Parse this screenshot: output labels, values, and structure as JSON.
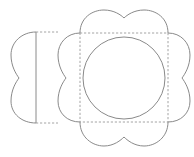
{
  "diagram": {
    "type": "die-cut template",
    "colors": {
      "background": "#ffffff",
      "line": "#8a8a8a",
      "dashed_line": "#9a9a9a"
    },
    "parts": [
      {
        "name": "main-flower-piece",
        "center_square": {
          "x": 80,
          "y": 33,
          "size": 88
        },
        "inner_circle": {
          "cx": 124,
          "cy": 78,
          "r": 41
        }
      },
      {
        "name": "side-flap-piece",
        "fold_line_x": 36,
        "y_range": [
          32,
          123
        ]
      }
    ],
    "legend": {
      "solid": "cut line",
      "dashed": "fold line"
    }
  }
}
